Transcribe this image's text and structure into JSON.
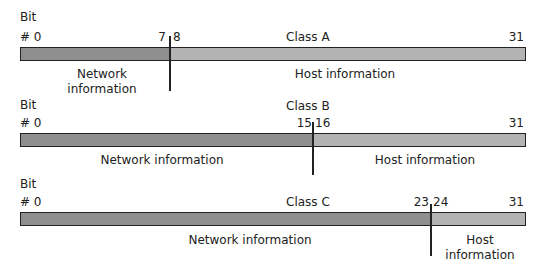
{
  "diagrams": [
    {
      "class_label": "Class A",
      "bit_label": "Bit",
      "start_label": "# 0",
      "split_label": "7 8",
      "split_left": "7",
      "split_right": "8",
      "end_label": "31",
      "network_label_line1": "Network",
      "network_label_line2": "information",
      "host_label": "Host information"
    },
    {
      "class_label": "Class B",
      "bit_label": "Bit",
      "start_label": "# 0",
      "split_left": "15",
      "split_right": "16",
      "end_label": "31",
      "network_label": "Network information",
      "host_label": "Host information"
    },
    {
      "class_label": "Class C",
      "bit_label": "Bit",
      "start_label": "# 0",
      "split_left": "23",
      "split_right": "24",
      "end_label": "31",
      "network_label": "Network information",
      "host_label_line1": "Host",
      "host_label_line2": "information"
    }
  ],
  "colors": {
    "network_segment": "#8f8f8f",
    "host_segment": "#b3b3b3",
    "outline": "#222222"
  }
}
